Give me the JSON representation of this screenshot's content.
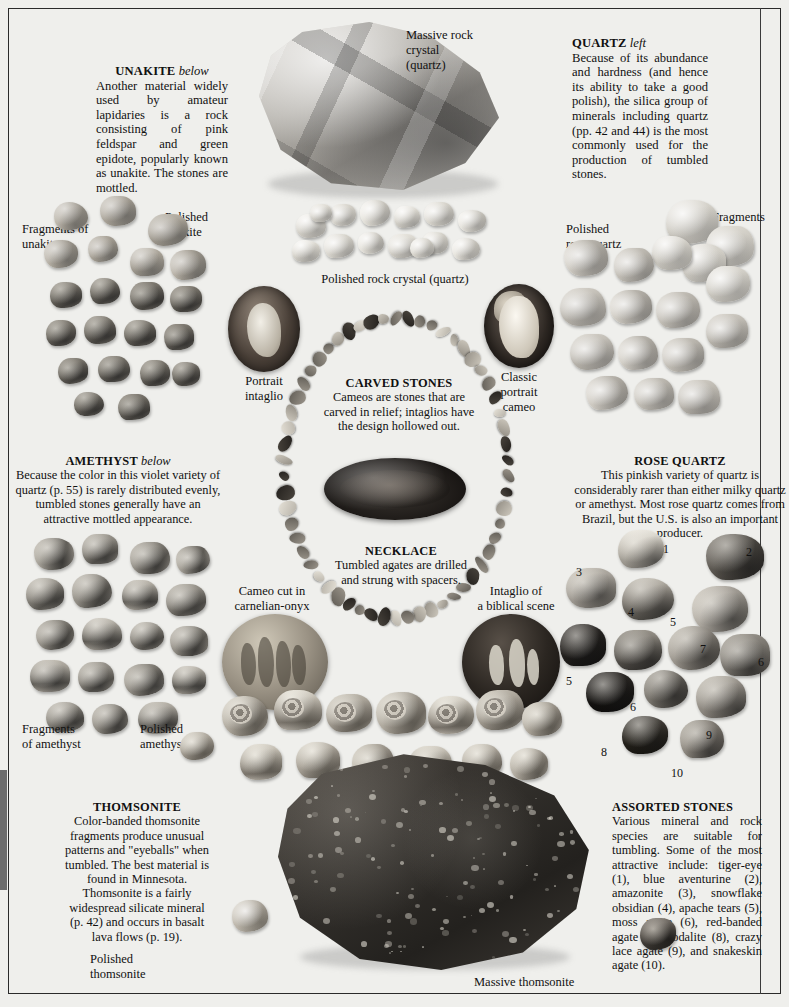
{
  "page": {
    "domain": "book-plate",
    "background_color": "#efefec",
    "text_color": "#111111"
  },
  "blocks": {
    "unakite": {
      "heading": "UNAKITE",
      "heading_italic": "below",
      "body": "Another material widely used by amateur lapidaries is a rock consisting of pink feldspar and green epidote, popularly known as unakite. The stones are mottled."
    },
    "quartz": {
      "heading": "QUARTZ",
      "heading_italic": "left",
      "body": "Because of its abundance and hardness (and hence its ability to take a good polish), the silica group of minerals including quartz (pp. 42 and 44) is the most commonly used for the production of tumbled stones."
    },
    "amethyst": {
      "heading": "AMETHYST",
      "heading_italic": "below",
      "body": "Because the color in this violet variety of quartz (p. 55) is rarely distributed evenly, tumbled stones generally have an attractive mottled appearance."
    },
    "rose_quartz": {
      "heading": "ROSE QUARTZ",
      "heading_italic": "",
      "body": "This pinkish variety of quartz is considerably rarer than either milky quartz or amethyst. Most rose quartz comes from Brazil, but the U.S. is also an important producer."
    },
    "carved_stones": {
      "heading": "CARVED STONES",
      "body": "Cameos are stones that are carved in relief; intaglios have the design hollowed out."
    },
    "necklace": {
      "heading": "NECKLACE",
      "body": "Tumbled agates are drilled and strung with spacers."
    },
    "thomsonite": {
      "heading": "THOMSONITE",
      "body": "Color-banded thomsonite fragments produce unusual patterns and \"eyeballs\" when tumbled. The best material is found in Minnesota. Thomsonite is a fairly widespread silicate mineral (p. 42) and occurs in basalt lava flows (p. 19)."
    },
    "assorted": {
      "heading": "ASSORTED STONES",
      "body": "Various mineral and rock species are suitable for tumbling. Some of the most attractive include: tiger-eye (1), blue aventurine (2), amazonite (3), snowflake obsidian (4), apache tears (5), moss agate (6), red-banded agate (7), sodalite (8), crazy lace agate (9), and snakeskin agate (10)."
    }
  },
  "labels": {
    "massive_rock_crystal": "Massive rock\ncrystal\n(quartz)",
    "massive_rock_crystal_l1": "Massive rock",
    "massive_rock_crystal_l2": "crystal",
    "massive_rock_crystal_l3": "(quartz)",
    "polished_rock_crystal": "Polished rock crystal (quartz)",
    "fragments_of_unakite": "Fragments of\nunakite",
    "fragments_of_unakite_l1": "Fragments of",
    "fragments_of_unakite_l2": "unakite",
    "polished_unakite_l1": "Polished",
    "polished_unakite_l2": "unakite",
    "polished_rose_quartz_l1": "Polished",
    "polished_rose_quartz_l2": "rose quartz",
    "fragments_rose_quartz_l1": "Fragments",
    "fragments_rose_quartz_l2": "of rose",
    "fragments_rose_quartz_l3": "quartz",
    "portrait_intaglio_l1": "Portrait",
    "portrait_intaglio_l2": "intaglio",
    "classic_cameo_l1": "Classic",
    "classic_cameo_l2": "portrait",
    "classic_cameo_l3": "cameo",
    "cameo_cut_l1": "Cameo cut in",
    "cameo_cut_l2": "carnelian-onyx",
    "intaglio_biblical_l1": "Intaglio of",
    "intaglio_biblical_l2": "a biblical scene",
    "fragments_amethyst_l1": "Fragments",
    "fragments_amethyst_l2": "of amethyst",
    "polished_amethyst_l1": "Polished",
    "polished_amethyst_l2": "amethyst",
    "polished_thomsonite_l1": "Polished",
    "polished_thomsonite_l2": "thomsonite",
    "massive_thomsonite": "Massive thomsonite"
  },
  "assorted_numbers": [
    "1",
    "2",
    "3",
    "4",
    "5",
    "6",
    "7",
    "6",
    "8",
    "9",
    "10"
  ],
  "assorted_key": [
    {
      "n": "1",
      "name": "tiger-eye"
    },
    {
      "n": "2",
      "name": "blue aventurine"
    },
    {
      "n": "3",
      "name": "amazonite"
    },
    {
      "n": "4",
      "name": "snowflake obsidian"
    },
    {
      "n": "5",
      "name": "apache tears"
    },
    {
      "n": "6",
      "name": "moss agate"
    },
    {
      "n": "7",
      "name": "red-banded agate"
    },
    {
      "n": "8",
      "name": "sodalite"
    },
    {
      "n": "9",
      "name": "crazy lace agate"
    },
    {
      "n": "10",
      "name": "snakeskin agate"
    }
  ]
}
